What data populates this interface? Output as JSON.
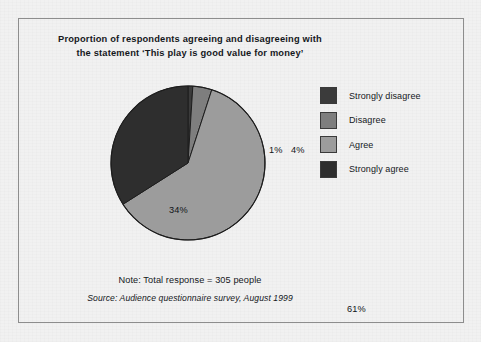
{
  "figure": {
    "title_line1": "Proportion of respondents agreeing and disagreeing with",
    "title_line2": "the statement ‘This play is good value for money’",
    "note": "Note: Total response = 305 people",
    "source": "Source: Audience questionnaire survey, August 1999",
    "background_color": "#f1f1f1",
    "border_color": "#8d8d8d"
  },
  "chart_data": {
    "type": "pie",
    "title": "Proportion of respondents agreeing and disagreeing with the statement ‘This play is good value for money’",
    "xlabel": "",
    "ylabel": "",
    "total_responses": 305,
    "start_angle_deg": 0,
    "direction": "clockwise",
    "grid": false,
    "legend_position": "right",
    "categories": [
      "Strongly disagree",
      "Disagree",
      "Agree",
      "Strongly agree"
    ],
    "values": [
      1,
      4,
      61,
      34
    ],
    "value_unit": "%",
    "colors": [
      "#3b3b3b",
      "#7e7e7e",
      "#9c9c9c",
      "#2e2e2e"
    ],
    "slices": [
      {
        "label": "Strongly disagree",
        "value": 1,
        "display": "1%",
        "color": "#3b3b3b"
      },
      {
        "label": "Disagree",
        "value": 4,
        "display": "4%",
        "color": "#7e7e7e"
      },
      {
        "label": "Agree",
        "value": 61,
        "display": "61%",
        "color": "#9c9c9c"
      },
      {
        "label": "Strongly agree",
        "value": 34,
        "display": "34%",
        "color": "#2e2e2e"
      }
    ],
    "slice_labels": [
      "1%",
      "4%",
      "61%",
      "34%"
    ],
    "legend": [
      {
        "label": "Strongly disagree",
        "color": "#3b3b3b"
      },
      {
        "label": "Disagree",
        "color": "#7e7e7e"
      },
      {
        "label": "Agree",
        "color": "#9c9c9c"
      },
      {
        "label": "Strongly agree",
        "color": "#2e2e2e"
      }
    ]
  }
}
